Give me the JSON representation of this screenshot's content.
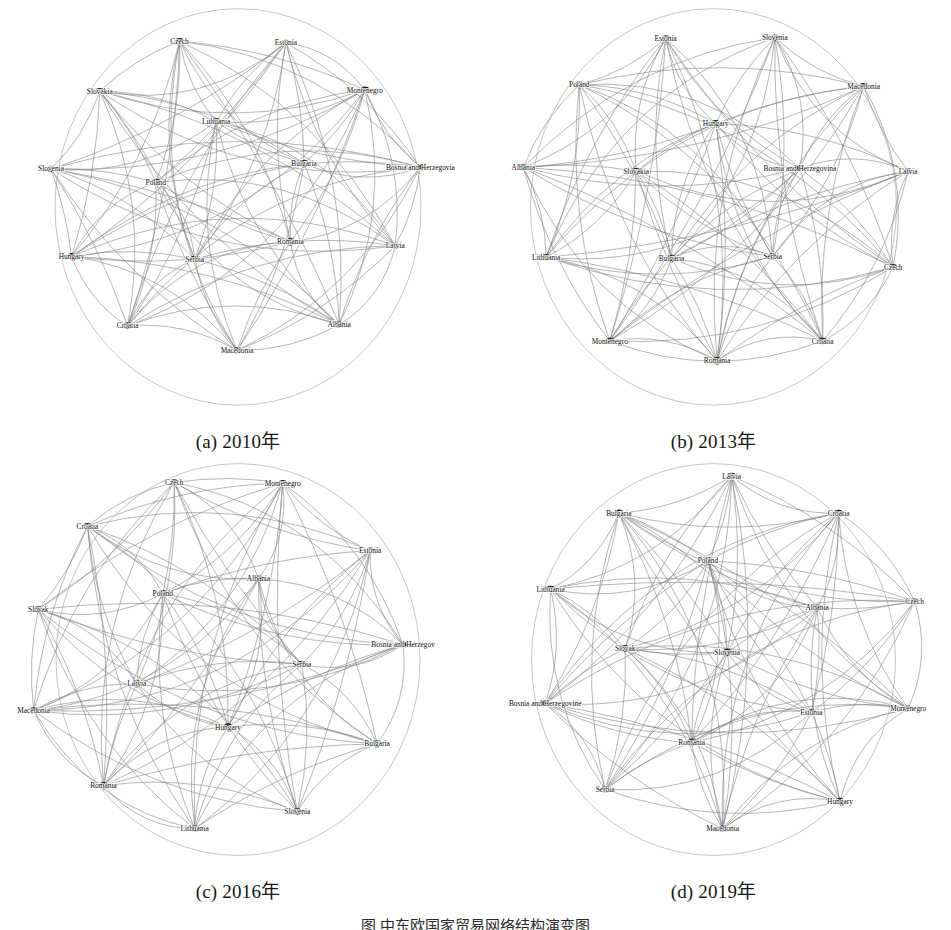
{
  "figure": {
    "type": "network-graph-grid",
    "rows": 2,
    "columns": 2,
    "bottom_caption": "图 中东欧国家贸易网络结构演变图",
    "edge_color": "#7d7d7d",
    "node_color": "#1c1c1c",
    "background_color": "#ffffff"
  },
  "chart_data": {
    "type": "network",
    "title": "",
    "layout": "circular",
    "panels": [
      {
        "key": "a",
        "caption": "(a) 2010年",
        "year": "2010",
        "node_count": 16,
        "nodes": [
          {
            "label": "Czech",
            "x": 0.372,
            "y": 0.082,
            "r": 3.8
          },
          {
            "label": "Estonia",
            "x": 0.605,
            "y": 0.086,
            "r": 3.6
          },
          {
            "label": "Montenegro",
            "x": 0.778,
            "y": 0.205,
            "r": 3.9
          },
          {
            "label": "Slovakia",
            "x": 0.197,
            "y": 0.208,
            "r": 3.8
          },
          {
            "label": "Lithuania",
            "x": 0.452,
            "y": 0.285,
            "r": 4.0
          },
          {
            "label": "Bulgaria",
            "x": 0.645,
            "y": 0.39,
            "r": 4.2
          },
          {
            "label": "Bosnia and Herzegovia",
            "x": 0.9,
            "y": 0.4,
            "r": 3.4
          },
          {
            "label": "Slovenia",
            "x": 0.09,
            "y": 0.404,
            "r": 3.6
          },
          {
            "label": "Poland",
            "x": 0.32,
            "y": 0.438,
            "r": 4.3
          },
          {
            "label": "Romania",
            "x": 0.615,
            "y": 0.588,
            "r": 4.4
          },
          {
            "label": "Latvia",
            "x": 0.845,
            "y": 0.598,
            "r": 3.7
          },
          {
            "label": "Hungary",
            "x": 0.135,
            "y": 0.625,
            "r": 4.2
          },
          {
            "label": "Serbia",
            "x": 0.405,
            "y": 0.632,
            "r": 4.0
          },
          {
            "label": "Croatia",
            "x": 0.258,
            "y": 0.8,
            "r": 3.9
          },
          {
            "label": "Albania",
            "x": 0.722,
            "y": 0.797,
            "r": 3.7
          },
          {
            "label": "Macedonia",
            "x": 0.498,
            "y": 0.862,
            "r": 3.9
          }
        ]
      },
      {
        "key": "b",
        "caption": "(b) 2013年",
        "year": "2013",
        "node_count": 16,
        "nodes": [
          {
            "label": "Estonia",
            "x": 0.395,
            "y": 0.075,
            "r": 3.8
          },
          {
            "label": "Slovenia",
            "x": 0.635,
            "y": 0.073,
            "r": 3.7
          },
          {
            "label": "Poland",
            "x": 0.205,
            "y": 0.192,
            "r": 4.0
          },
          {
            "label": "Macedonia",
            "x": 0.83,
            "y": 0.196,
            "r": 3.9
          },
          {
            "label": "Hungary",
            "x": 0.505,
            "y": 0.29,
            "r": 4.3
          },
          {
            "label": "Albania",
            "x": 0.082,
            "y": 0.4,
            "r": 3.7
          },
          {
            "label": "Slovakia",
            "x": 0.33,
            "y": 0.41,
            "r": 4.0
          },
          {
            "label": "Bosnia and Herzegovina",
            "x": 0.69,
            "y": 0.403,
            "r": 3.5
          },
          {
            "label": "Latvia",
            "x": 0.928,
            "y": 0.41,
            "r": 3.6
          },
          {
            "label": "Lithuania",
            "x": 0.132,
            "y": 0.627,
            "r": 3.9
          },
          {
            "label": "Bulgaria",
            "x": 0.408,
            "y": 0.63,
            "r": 4.3
          },
          {
            "label": "Serbia",
            "x": 0.63,
            "y": 0.625,
            "r": 4.2
          },
          {
            "label": "Czech",
            "x": 0.895,
            "y": 0.652,
            "r": 3.7
          },
          {
            "label": "Montenegro",
            "x": 0.272,
            "y": 0.838,
            "r": 3.8
          },
          {
            "label": "Romania",
            "x": 0.508,
            "y": 0.888,
            "r": 4.4
          },
          {
            "label": "Croatia",
            "x": 0.74,
            "y": 0.838,
            "r": 3.9
          }
        ]
      },
      {
        "key": "c",
        "caption": "(c) 2016年",
        "year": "2016",
        "node_count": 16,
        "nodes": [
          {
            "label": "Czech",
            "x": 0.36,
            "y": 0.048,
            "r": 3.8
          },
          {
            "label": "Montenegro",
            "x": 0.598,
            "y": 0.05,
            "r": 3.9
          },
          {
            "label": "Croatia",
            "x": 0.17,
            "y": 0.16,
            "r": 3.9
          },
          {
            "label": "Estonia",
            "x": 0.79,
            "y": 0.222,
            "r": 3.6
          },
          {
            "label": "Albania",
            "x": 0.545,
            "y": 0.294,
            "r": 4.0
          },
          {
            "label": "Poland",
            "x": 0.335,
            "y": 0.332,
            "r": 4.3
          },
          {
            "label": "Slovak",
            "x": 0.062,
            "y": 0.372,
            "r": 3.8
          },
          {
            "label": "Bosnia and Herzegov",
            "x": 0.862,
            "y": 0.462,
            "r": 3.4
          },
          {
            "label": "Serbia",
            "x": 0.64,
            "y": 0.512,
            "r": 4.1
          },
          {
            "label": "Latvia",
            "x": 0.278,
            "y": 0.562,
            "r": 4.2
          },
          {
            "label": "Macedonia",
            "x": 0.052,
            "y": 0.63,
            "r": 3.7
          },
          {
            "label": "Hungary",
            "x": 0.478,
            "y": 0.672,
            "r": 4.3
          },
          {
            "label": "Bulgaria",
            "x": 0.805,
            "y": 0.715,
            "r": 4.2
          },
          {
            "label": "Romania",
            "x": 0.205,
            "y": 0.822,
            "r": 4.3
          },
          {
            "label": "Slovenia",
            "x": 0.63,
            "y": 0.888,
            "r": 3.8
          },
          {
            "label": "Lithuania",
            "x": 0.405,
            "y": 0.932,
            "r": 3.9
          }
        ]
      },
      {
        "key": "d",
        "caption": "(d) 2019年",
        "year": "2019",
        "node_count": 16,
        "nodes": [
          {
            "label": "Latvia",
            "x": 0.54,
            "y": 0.032,
            "r": 3.9
          },
          {
            "label": "Bulgaria",
            "x": 0.292,
            "y": 0.126,
            "r": 4.1
          },
          {
            "label": "Croatia",
            "x": 0.775,
            "y": 0.126,
            "r": 4.0
          },
          {
            "label": "Poland",
            "x": 0.488,
            "y": 0.248,
            "r": 4.3
          },
          {
            "label": "Lithuania",
            "x": 0.142,
            "y": 0.32,
            "r": 3.9
          },
          {
            "label": "Albania",
            "x": 0.728,
            "y": 0.368,
            "r": 3.9
          },
          {
            "label": "Czech",
            "x": 0.942,
            "y": 0.352,
            "r": 3.6
          },
          {
            "label": "Slovak",
            "x": 0.306,
            "y": 0.472,
            "r": 4.1
          },
          {
            "label": "Slovenia",
            "x": 0.53,
            "y": 0.482,
            "r": 4.4
          },
          {
            "label": "Bosnia and Herzegovine",
            "x": 0.13,
            "y": 0.612,
            "r": 3.4
          },
          {
            "label": "Estonia",
            "x": 0.715,
            "y": 0.635,
            "r": 3.8
          },
          {
            "label": "Montenegro",
            "x": 0.928,
            "y": 0.625,
            "r": 3.7
          },
          {
            "label": "Romania",
            "x": 0.452,
            "y": 0.712,
            "r": 4.3
          },
          {
            "label": "Serbia",
            "x": 0.262,
            "y": 0.832,
            "r": 4.0
          },
          {
            "label": "Hungary",
            "x": 0.778,
            "y": 0.862,
            "r": 4.3
          },
          {
            "label": "Macedonia",
            "x": 0.52,
            "y": 0.932,
            "r": 3.9
          }
        ]
      }
    ]
  }
}
